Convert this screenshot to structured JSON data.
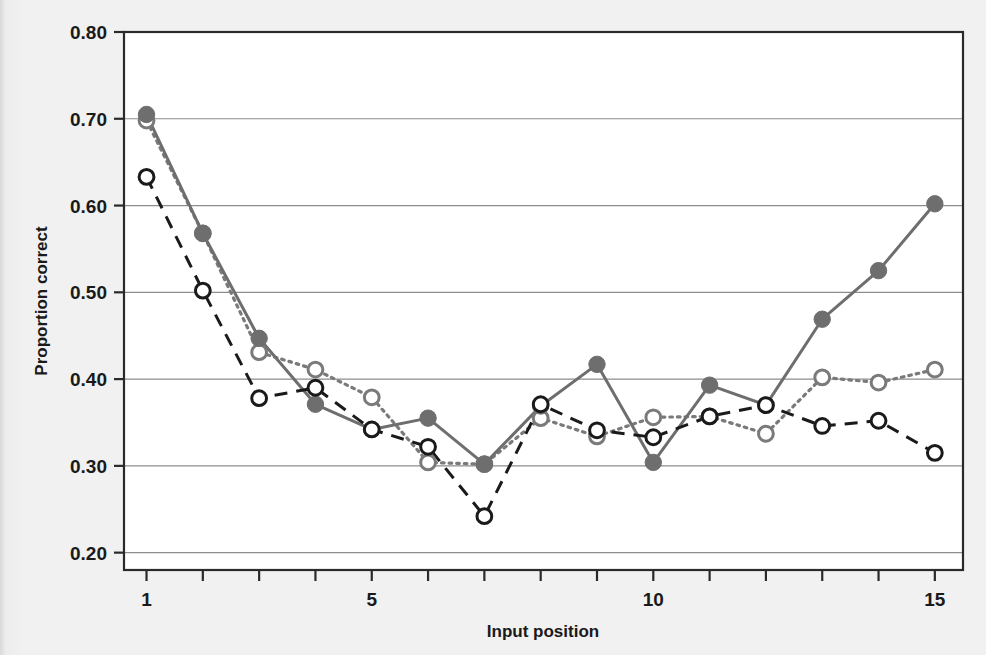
{
  "chart_data": {
    "type": "line",
    "title": "",
    "subtitle": "",
    "xlabel": "Input position",
    "ylabel": "Proportion correct",
    "x": [
      1,
      2,
      3,
      4,
      5,
      6,
      7,
      8,
      9,
      10,
      11,
      12,
      13,
      14,
      15
    ],
    "xlim": [
      0.6,
      15.5
    ],
    "ylim": [
      0.18,
      0.8
    ],
    "x_tick_values": [
      1,
      2,
      3,
      4,
      5,
      6,
      7,
      8,
      9,
      10,
      11,
      12,
      13,
      14,
      15
    ],
    "x_tick_labels": [
      "1",
      "",
      "",
      "",
      "5",
      "",
      "",
      "",
      "",
      "10",
      "",
      "",
      "",
      "",
      "15"
    ],
    "y_ticks": [
      0.2,
      0.3,
      0.4,
      0.5,
      0.6,
      0.7,
      0.8
    ],
    "y_tick_labels": [
      "0.20",
      "0.30",
      "0.40",
      "0.50",
      "0.60",
      "0.70",
      "0.80"
    ],
    "grid": "horizontal",
    "legend": "none",
    "series": [
      {
        "name": "series-solid-filled",
        "marker": "filled-circle",
        "line_style": "solid",
        "color": "#6e6e6e",
        "values": [
          0.705,
          0.568,
          0.447,
          0.371,
          0.342,
          0.355,
          0.302,
          0.369,
          0.417,
          0.304,
          0.393,
          0.37,
          0.469,
          0.525,
          0.602
        ]
      },
      {
        "name": "series-dotted-open-gray",
        "marker": "open-circle",
        "line_style": "dotted",
        "color": "#7a7a7a",
        "values": [
          0.698,
          0.568,
          0.431,
          0.411,
          0.379,
          0.304,
          0.302,
          0.355,
          0.334,
          0.356,
          0.357,
          0.337,
          0.402,
          0.396,
          0.411
        ]
      },
      {
        "name": "series-dashed-open-black",
        "marker": "open-circle",
        "line_style": "dashed",
        "color": "#1a1a1a",
        "values": [
          0.633,
          0.502,
          0.378,
          0.39,
          0.342,
          0.322,
          0.242,
          0.371,
          0.341,
          0.333,
          0.357,
          0.37,
          0.346,
          0.352,
          0.315
        ]
      }
    ]
  },
  "axes": {
    "y_title": "Proportion correct",
    "x_title": "Input position"
  },
  "colors": {
    "page_background": "#f1f1f1",
    "plot_background": "#ffffff",
    "frame": "#2a2a2a",
    "gridline": "#8d8d8d",
    "gray_series": "#6e6e6e",
    "black_series": "#1a1a1a"
  }
}
